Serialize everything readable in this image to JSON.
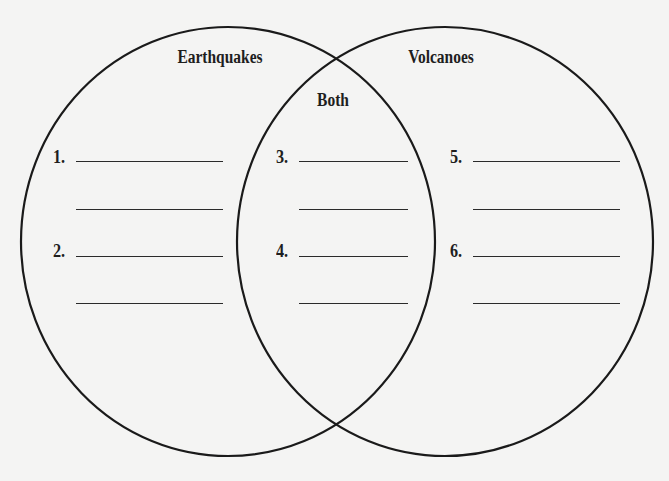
{
  "diagram": {
    "type": "venn",
    "stroke_color": "#1a1a1a",
    "background": "#f4f4f3",
    "circles": [
      {
        "id": "left",
        "label": "Earthquakes",
        "cx": 228,
        "cy": 241.5,
        "rx": 207,
        "ry": 214.5
      },
      {
        "id": "right",
        "label": "Volcanoes",
        "cx": 445,
        "cy": 241.5,
        "rx": 208,
        "ry": 214.5
      }
    ],
    "overlap_label": "Both"
  },
  "labels": {
    "left": "Earthquakes",
    "right": "Volcanoes",
    "overlap": "Both"
  },
  "items": [
    {
      "number": "1.",
      "region": "Earthquakes",
      "value": ""
    },
    {
      "number": "2.",
      "region": "Earthquakes",
      "value": ""
    },
    {
      "number": "3.",
      "region": "Both",
      "value": ""
    },
    {
      "number": "4.",
      "region": "Both",
      "value": ""
    },
    {
      "number": "5.",
      "region": "Volcanoes",
      "value": ""
    },
    {
      "number": "6.",
      "region": "Volcanoes",
      "value": ""
    }
  ]
}
